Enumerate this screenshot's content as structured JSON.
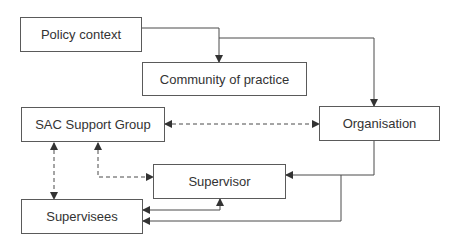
{
  "diagram": {
    "type": "flowchart",
    "nodes": [
      {
        "id": "policy",
        "label": "Policy context"
      },
      {
        "id": "community",
        "label": "Community of practice"
      },
      {
        "id": "sac",
        "label": "SAC Support Group"
      },
      {
        "id": "organisation",
        "label": "Organisation"
      },
      {
        "id": "supervisor",
        "label": "Supervisor"
      },
      {
        "id": "supervisees",
        "label": "Supervisees"
      }
    ],
    "edges": [
      {
        "from": "policy",
        "to": "community",
        "style": "solid",
        "direction": "one-way"
      },
      {
        "from": "policy",
        "to": "organisation",
        "style": "solid",
        "direction": "one-way"
      },
      {
        "from": "sac",
        "to": "organisation",
        "style": "dashed",
        "direction": "two-way"
      },
      {
        "from": "sac",
        "to": "supervisees",
        "style": "dashed",
        "direction": "two-way"
      },
      {
        "from": "sac",
        "to": "supervisor",
        "style": "dashed",
        "direction": "two-way"
      },
      {
        "from": "organisation",
        "to": "supervisor",
        "style": "solid",
        "direction": "one-way"
      },
      {
        "from": "organisation",
        "to": "supervisees",
        "style": "solid",
        "direction": "one-way"
      },
      {
        "from": "supervisor",
        "to": "supervisees",
        "style": "solid",
        "direction": "two-way"
      }
    ],
    "colors": {
      "line": "#4a4a4a",
      "border": "#5a5a5a",
      "text": "#333333"
    }
  }
}
